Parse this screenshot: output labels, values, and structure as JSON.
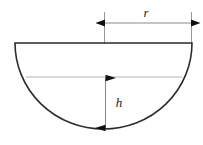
{
  "figure": {
    "canvas": {
      "width": 203,
      "height": 145,
      "background": "#ffffff"
    },
    "colors": {
      "outline": "#2b2b2b",
      "chord": "#b5b5b5",
      "extension_line": "#9a9a9a",
      "dimension_line": "#8c8c8c",
      "arrow_fill": "#111111",
      "label_text": "#1a1a1a"
    },
    "shape": {
      "name": "semicircle",
      "diameter_y": 43,
      "left_x": 15,
      "right_x": 192,
      "center_x": 104,
      "bottom_y": 129,
      "radius_px": 88
    },
    "chord": {
      "name": "water-level-chord",
      "y": 77,
      "left_x": 26,
      "right_x": 182
    },
    "dimensions": [
      {
        "id": "radius",
        "label": "r",
        "orientation": "horizontal",
        "line_y": 23,
        "from_x": 105,
        "to_x": 191,
        "label_x": 146,
        "label_y": 17,
        "arrows": "both"
      },
      {
        "id": "height",
        "label": "h",
        "orientation": "vertical",
        "line_x": 105,
        "from_y": 78,
        "to_y": 128,
        "label_x": 119,
        "label_y": 107,
        "arrows": "both"
      }
    ],
    "extension_lines": [
      {
        "id": "left-extension",
        "x": 104,
        "from_y": 12,
        "to_y": 44
      },
      {
        "id": "right-extension",
        "x": 192,
        "from_y": 12,
        "to_y": 44
      }
    ]
  }
}
